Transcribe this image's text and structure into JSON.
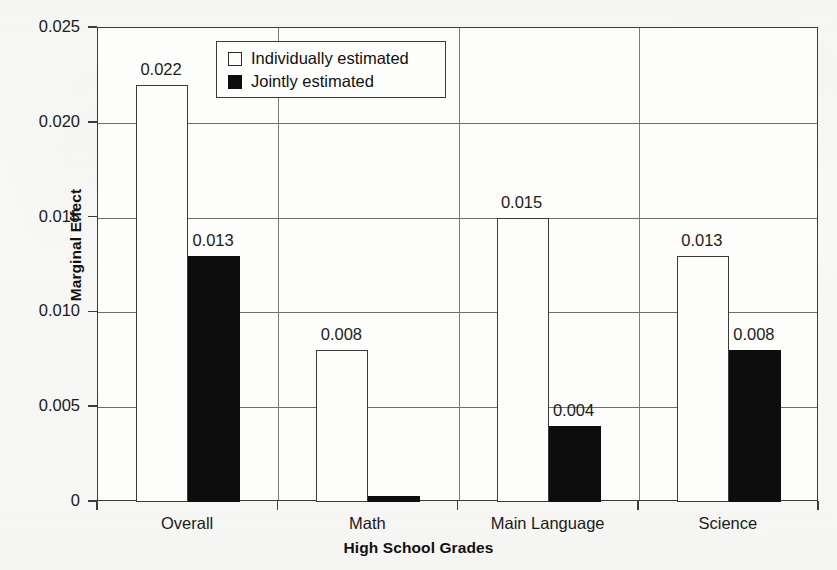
{
  "chart_data": {
    "type": "bar",
    "title": "",
    "xlabel": "High School Grades",
    "ylabel": "Marginal Effect",
    "categories": [
      "Overall",
      "Math",
      "Main Language",
      "Science"
    ],
    "ylim": [
      0,
      0.025
    ],
    "ytick_values": [
      0,
      0.005,
      0.01,
      0.015,
      0.02,
      0.025
    ],
    "ytick_labels": [
      "0",
      "0.005",
      "0.010",
      "0.015",
      "0.020",
      "0.025"
    ],
    "grid": "horizontal",
    "legend_position": "top-center-inside",
    "series": [
      {
        "name": "Individually estimated",
        "color": "#ffffff",
        "edge_color": "#000000",
        "values": [
          0.022,
          0.008,
          0.015,
          0.013
        ],
        "labels": [
          "0.022",
          "0.008",
          "0.015",
          "0.013"
        ]
      },
      {
        "name": "Jointly estimated",
        "color": "#000000",
        "edge_color": "#000000",
        "values": [
          0.013,
          0.0003,
          0.004,
          0.008
        ],
        "labels": [
          "0.013",
          "",
          "0.004",
          "0.008"
        ]
      }
    ]
  },
  "legend": {
    "items": [
      {
        "label": "Individually estimated",
        "swatch": "white-square"
      },
      {
        "label": "Jointly estimated",
        "swatch": "black-square"
      }
    ]
  },
  "axes": {
    "y_title": "Marginal Effect",
    "x_title": "High School Grades"
  }
}
